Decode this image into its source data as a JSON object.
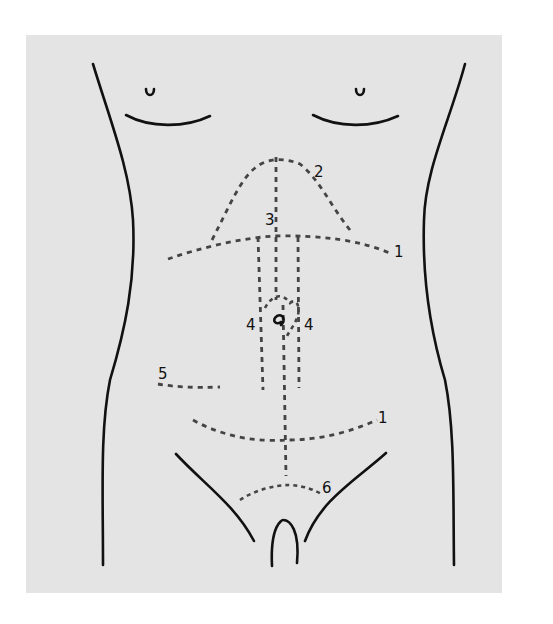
{
  "diagram": {
    "colors": {
      "background": "#e4e4e4",
      "outline": "#111111",
      "incision": "#444444",
      "page": "#ffffff"
    },
    "labels": [
      {
        "id": "label-1-upper",
        "text": "1"
      },
      {
        "id": "label-2",
        "text": "2"
      },
      {
        "id": "label-3",
        "text": "3"
      },
      {
        "id": "label-4-left",
        "text": "4"
      },
      {
        "id": "label-4-right",
        "text": "4"
      },
      {
        "id": "label-5",
        "text": "5"
      },
      {
        "id": "label-1-lower",
        "text": "1"
      },
      {
        "id": "label-6",
        "text": "6"
      }
    ]
  }
}
